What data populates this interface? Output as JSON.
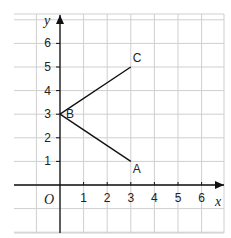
{
  "diagram": {
    "type": "coordinate-grid",
    "axes": {
      "x_label": "x",
      "y_label": "y",
      "origin_label": "O",
      "x_ticks": [
        "1",
        "2",
        "3",
        "4",
        "5",
        "6"
      ],
      "y_ticks": [
        "1",
        "2",
        "3",
        "4",
        "5",
        "6"
      ]
    },
    "points": [
      {
        "label": "A",
        "x": 3,
        "y": 1
      },
      {
        "label": "B",
        "x": 0,
        "y": 3
      },
      {
        "label": "C",
        "x": 3,
        "y": 5
      }
    ],
    "segments": [
      [
        "B",
        "A"
      ],
      [
        "B",
        "C"
      ]
    ],
    "colors": {
      "grid": "#d0d0d0",
      "axis": "#111111",
      "line": "#111111"
    }
  }
}
